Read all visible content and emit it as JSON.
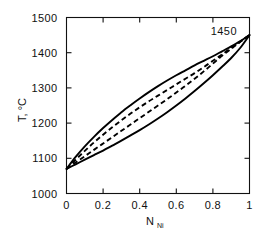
{
  "figure": {
    "background": "#ffffff",
    "ink": "#000000"
  },
  "annotations": [
    {
      "text": "1450",
      "x": 0.86,
      "y": 1462
    }
  ],
  "chart_data": {
    "type": "line",
    "title": "",
    "xlabel": "N",
    "xlabel_sub": "Ni",
    "ylabel": "T, °C",
    "xlim": [
      0,
      1
    ],
    "ylim": [
      1000,
      1500
    ],
    "xticks": [
      0,
      0.2,
      0.4,
      0.6,
      0.8,
      1
    ],
    "xticklabels": [
      "0",
      "0.2",
      "0.4",
      "0.6",
      "0.8",
      "1"
    ],
    "yticks": [
      1000,
      1100,
      1200,
      1300,
      1400,
      1500
    ],
    "yticklabels": [
      "1000",
      "1100",
      "1200",
      "1300",
      "1400",
      "1500"
    ],
    "grid": false,
    "legend": null,
    "tick_direction": "in",
    "frame": "box",
    "endpoints": {
      "pure_A_melting": 1070,
      "pure_B_melting": 1450
    },
    "series": [
      {
        "name": "liquidus-solid",
        "style": "solid",
        "x": [
          0,
          0.05,
          0.1,
          0.15,
          0.2,
          0.25,
          0.3,
          0.35,
          0.4,
          0.45,
          0.5,
          0.55,
          0.6,
          0.65,
          0.7,
          0.75,
          0.8,
          0.85,
          0.9,
          0.95,
          1
        ],
        "values": [
          1070,
          1104,
          1134,
          1161,
          1186,
          1209,
          1231,
          1251,
          1270,
          1288,
          1305,
          1321,
          1336,
          1350,
          1364,
          1377,
          1390,
          1404,
          1418,
          1433,
          1450
        ]
      },
      {
        "name": "solidus-solid",
        "style": "solid",
        "x": [
          0,
          0.05,
          0.1,
          0.15,
          0.2,
          0.25,
          0.3,
          0.35,
          0.4,
          0.45,
          0.5,
          0.55,
          0.6,
          0.65,
          0.7,
          0.75,
          0.8,
          0.85,
          0.9,
          0.95,
          1
        ],
        "values": [
          1070,
          1083,
          1096,
          1109,
          1122,
          1136,
          1150,
          1165,
          1180,
          1196,
          1213,
          1231,
          1250,
          1270,
          1291,
          1313,
          1336,
          1360,
          1385,
          1414,
          1450
        ]
      },
      {
        "name": "liquidus-dashed",
        "style": "dashed",
        "x": [
          0,
          0.05,
          0.1,
          0.15,
          0.2,
          0.25,
          0.3,
          0.35,
          0.4,
          0.45,
          0.5,
          0.55,
          0.6,
          0.65,
          0.7,
          0.75,
          0.8,
          0.85,
          0.9,
          0.95,
          1
        ],
        "values": [
          1070,
          1096,
          1121,
          1145,
          1167,
          1188,
          1208,
          1227,
          1245,
          1262,
          1278,
          1294,
          1310,
          1326,
          1342,
          1359,
          1377,
          1395,
          1414,
          1432,
          1450
        ]
      },
      {
        "name": "solidus-dashed",
        "style": "dashed",
        "x": [
          0,
          0.05,
          0.1,
          0.15,
          0.2,
          0.25,
          0.3,
          0.35,
          0.4,
          0.45,
          0.5,
          0.55,
          0.6,
          0.65,
          0.7,
          0.75,
          0.8,
          0.85,
          0.9,
          0.95,
          1
        ],
        "values": [
          1070,
          1088,
          1106,
          1124,
          1142,
          1160,
          1178,
          1196,
          1214,
          1232,
          1250,
          1268,
          1287,
          1306,
          1326,
          1347,
          1369,
          1391,
          1411,
          1431,
          1450
        ]
      }
    ]
  }
}
